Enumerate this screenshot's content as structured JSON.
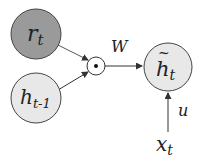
{
  "diagram": {
    "nodes": {
      "r": {
        "label": "r",
        "sub": "t",
        "fill": "#9a9a9a"
      },
      "hprev": {
        "label": "h",
        "sub": "t-1",
        "fill": "#e8e8e8"
      },
      "mult": {
        "label": "⊙"
      },
      "htilde": {
        "label": "h",
        "sub": "t",
        "tilde": "~",
        "fill": "#e8e8e8"
      },
      "x": {
        "label": "x",
        "sub": "t"
      }
    },
    "edges": {
      "W": "W",
      "u": "u"
    },
    "colors": {
      "stroke": "#444444",
      "arrow": "#333333"
    }
  }
}
